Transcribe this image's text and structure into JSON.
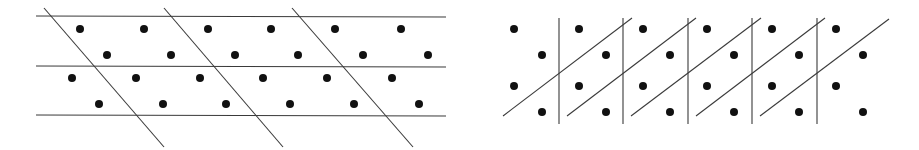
{
  "diagrams": [
    {
      "name": "left-lattice-oblique-cell",
      "lines": [
        {
          "x1": 36,
          "y1": 16,
          "x2": 446,
          "y2": 17
        },
        {
          "x1": 36,
          "y1": 66,
          "x2": 446,
          "y2": 67
        },
        {
          "x1": 36,
          "y1": 115,
          "x2": 446,
          "y2": 116
        },
        {
          "x1": 44,
          "y1": 8,
          "x2": 164,
          "y2": 147
        },
        {
          "x1": 164,
          "y1": 8,
          "x2": 283,
          "y2": 147
        },
        {
          "x1": 292,
          "y1": 8,
          "x2": 413,
          "y2": 147
        }
      ],
      "dots": [
        [
          80,
          29
        ],
        [
          144,
          29
        ],
        [
          208,
          29
        ],
        [
          271,
          29
        ],
        [
          335,
          29
        ],
        [
          401,
          29
        ],
        [
          107,
          55
        ],
        [
          171,
          55
        ],
        [
          235,
          55
        ],
        [
          298,
          55
        ],
        [
          363,
          55
        ],
        [
          428,
          55
        ],
        [
          72,
          78
        ],
        [
          136,
          78
        ],
        [
          200,
          78
        ],
        [
          263,
          78
        ],
        [
          327,
          78
        ],
        [
          392,
          78
        ],
        [
          99,
          104
        ],
        [
          163,
          104
        ],
        [
          226,
          104
        ],
        [
          290,
          104
        ],
        [
          354,
          104
        ],
        [
          419,
          104
        ]
      ]
    },
    {
      "name": "right-lattice-oblique-cell",
      "lines": [
        {
          "x1": 559,
          "y1": 18,
          "x2": 559,
          "y2": 124
        },
        {
          "x1": 623,
          "y1": 18,
          "x2": 623,
          "y2": 124
        },
        {
          "x1": 688,
          "y1": 18,
          "x2": 688,
          "y2": 124
        },
        {
          "x1": 752,
          "y1": 18,
          "x2": 752,
          "y2": 124
        },
        {
          "x1": 817,
          "y1": 18,
          "x2": 817,
          "y2": 124
        },
        {
          "x1": 503,
          "y1": 116,
          "x2": 632,
          "y2": 18
        },
        {
          "x1": 567,
          "y1": 116,
          "x2": 696,
          "y2": 18
        },
        {
          "x1": 631,
          "y1": 116,
          "x2": 761,
          "y2": 18
        },
        {
          "x1": 696,
          "y1": 116,
          "x2": 825,
          "y2": 18
        },
        {
          "x1": 760,
          "y1": 116,
          "x2": 889,
          "y2": 19
        }
      ],
      "dots": [
        [
          514,
          29
        ],
        [
          579,
          29
        ],
        [
          643,
          29
        ],
        [
          707,
          29
        ],
        [
          772,
          29
        ],
        [
          836,
          29
        ],
        [
          542,
          55
        ],
        [
          606,
          55
        ],
        [
          670,
          55
        ],
        [
          734,
          55
        ],
        [
          799,
          55
        ],
        [
          863,
          55
        ],
        [
          514,
          86
        ],
        [
          579,
          86
        ],
        [
          643,
          86
        ],
        [
          707,
          86
        ],
        [
          772,
          86
        ],
        [
          836,
          86
        ],
        [
          542,
          112
        ],
        [
          606,
          112
        ],
        [
          670,
          112
        ],
        [
          734,
          112
        ],
        [
          799,
          112
        ],
        [
          863,
          112
        ]
      ]
    }
  ],
  "style": {
    "line_color": "#3a3a3a",
    "dot_color": "#111111",
    "dot_radius": 4
  }
}
